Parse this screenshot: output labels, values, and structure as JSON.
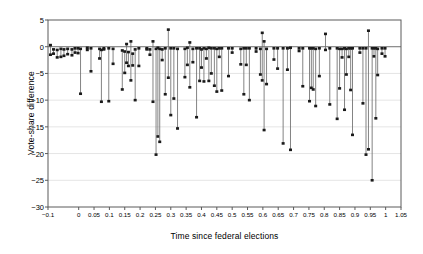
{
  "chart_data": {
    "type": "scatter",
    "title": "",
    "xlabel": "Time since federal elections",
    "ylabel": "Vote-share difference",
    "xlim": [
      -0.1,
      1.05
    ],
    "ylim": [
      -30,
      5
    ],
    "grid": true,
    "legend": null,
    "marker": "filled-square-with-vertical-range-line",
    "xticks": [
      "-0.1",
      "0",
      "0.05",
      "0.1",
      "0.15",
      "0.2",
      "0.25",
      "0.3",
      "0.35",
      "0.4",
      "0.45",
      "0.5",
      "0.55",
      "0.6",
      "0.65",
      "0.7",
      "0.75",
      "0.8",
      "0.85",
      "0.9",
      "0.95",
      "1",
      "1.05"
    ],
    "xtick_values": [
      -0.1,
      0,
      0.05,
      0.1,
      0.15,
      0.2,
      0.25,
      0.3,
      0.35,
      0.4,
      0.45,
      0.5,
      0.55,
      0.6,
      0.65,
      0.7,
      0.75,
      0.8,
      0.85,
      0.9,
      0.95,
      1,
      1.05
    ],
    "yticks": [
      "5",
      "0",
      "-5",
      "-10",
      "-15",
      "-20",
      "-25",
      "-30"
    ],
    "ytick_values": [
      5,
      0,
      -5,
      -10,
      -15,
      -20,
      -25,
      -30
    ],
    "series": [
      {
        "name": "Vote-share difference range",
        "points": [
          {
            "x": -0.092,
            "top": 0.3,
            "bottom": -1.5
          },
          {
            "x": -0.082,
            "top": -0.5,
            "bottom": -1.3
          },
          {
            "x": -0.07,
            "top": -0.6,
            "bottom": -2.0
          },
          {
            "x": -0.058,
            "top": -0.4,
            "bottom": -1.9
          },
          {
            "x": -0.048,
            "top": -0.5,
            "bottom": -1.7
          },
          {
            "x": -0.036,
            "top": -0.4,
            "bottom": -1.4
          },
          {
            "x": -0.022,
            "top": -0.5,
            "bottom": -1.6
          },
          {
            "x": -0.012,
            "top": -0.3,
            "bottom": -1.1
          },
          {
            "x": -0.002,
            "top": -0.3,
            "bottom": -1.2
          },
          {
            "x": 0.006,
            "top": -0.4,
            "bottom": -8.8
          },
          {
            "x": 0.028,
            "top": -0.2,
            "bottom": -0.6
          },
          {
            "x": 0.04,
            "top": -0.3,
            "bottom": -4.6
          },
          {
            "x": 0.068,
            "top": -0.4,
            "bottom": -2.2
          },
          {
            "x": 0.074,
            "top": -0.6,
            "bottom": -10.3
          },
          {
            "x": 0.082,
            "top": -0.3,
            "bottom": -0.5
          },
          {
            "x": 0.098,
            "top": -0.3,
            "bottom": -10.2
          },
          {
            "x": 0.112,
            "top": -0.4,
            "bottom": -3.2
          },
          {
            "x": 0.142,
            "top": -0.7,
            "bottom": -8.0
          },
          {
            "x": 0.15,
            "top": -0.9,
            "bottom": -4.9
          },
          {
            "x": 0.156,
            "top": 0.5,
            "bottom": -3.0
          },
          {
            "x": 0.162,
            "top": -1.0,
            "bottom": -3.6
          },
          {
            "x": 0.17,
            "top": 1.0,
            "bottom": -6.3
          },
          {
            "x": 0.176,
            "top": -1.3,
            "bottom": -3.5
          },
          {
            "x": 0.184,
            "top": -0.5,
            "bottom": -10.0
          },
          {
            "x": 0.196,
            "top": -0.3,
            "bottom": -3.6
          },
          {
            "x": 0.222,
            "top": -0.3,
            "bottom": -0.5
          },
          {
            "x": 0.232,
            "top": -0.5,
            "bottom": -1.5
          },
          {
            "x": 0.242,
            "top": 1.0,
            "bottom": -10.3
          },
          {
            "x": 0.252,
            "top": -0.4,
            "bottom": -20.2
          },
          {
            "x": 0.258,
            "top": -0.2,
            "bottom": -16.8
          },
          {
            "x": 0.264,
            "top": -0.4,
            "bottom": -17.8
          },
          {
            "x": 0.272,
            "top": -0.5,
            "bottom": -2.5
          },
          {
            "x": 0.282,
            "top": -0.3,
            "bottom": -8.9
          },
          {
            "x": 0.292,
            "top": 3.2,
            "bottom": -5.8
          },
          {
            "x": 0.3,
            "top": -0.3,
            "bottom": -12.8
          },
          {
            "x": 0.31,
            "top": -0.3,
            "bottom": -9.7
          },
          {
            "x": 0.322,
            "top": -0.4,
            "bottom": -15.3
          },
          {
            "x": 0.346,
            "top": -0.4,
            "bottom": -5.7
          },
          {
            "x": 0.354,
            "top": -0.2,
            "bottom": -3.4
          },
          {
            "x": 0.362,
            "top": 0.8,
            "bottom": -7.6
          },
          {
            "x": 0.372,
            "top": -0.4,
            "bottom": -2.9
          },
          {
            "x": 0.384,
            "top": -0.3,
            "bottom": -13.2
          },
          {
            "x": 0.394,
            "top": -0.3,
            "bottom": -6.4
          },
          {
            "x": 0.4,
            "top": -0.5,
            "bottom": -3.9
          },
          {
            "x": 0.408,
            "top": -0.3,
            "bottom": -6.5
          },
          {
            "x": 0.416,
            "top": -0.4,
            "bottom": -2.2
          },
          {
            "x": 0.424,
            "top": -0.2,
            "bottom": -6.4
          },
          {
            "x": 0.432,
            "top": -0.3,
            "bottom": -5.0
          },
          {
            "x": 0.442,
            "top": -0.3,
            "bottom": -7.3
          },
          {
            "x": 0.45,
            "top": -0.4,
            "bottom": -8.4
          },
          {
            "x": 0.458,
            "top": -0.3,
            "bottom": -1.9
          },
          {
            "x": 0.466,
            "top": -0.3,
            "bottom": -8.2
          },
          {
            "x": 0.488,
            "top": -0.3,
            "bottom": -5.5
          },
          {
            "x": 0.5,
            "top": -0.3,
            "bottom": -1.1
          },
          {
            "x": 0.528,
            "top": -0.4,
            "bottom": -3.3
          },
          {
            "x": 0.538,
            "top": -0.3,
            "bottom": -8.9
          },
          {
            "x": 0.546,
            "top": -0.3,
            "bottom": -3.4
          },
          {
            "x": 0.556,
            "top": -0.3,
            "bottom": -10.0
          },
          {
            "x": 0.578,
            "top": -0.3,
            "bottom": -0.9
          },
          {
            "x": 0.592,
            "top": -0.4,
            "bottom": -5.2
          },
          {
            "x": 0.598,
            "top": 2.6,
            "bottom": -6.3
          },
          {
            "x": 0.604,
            "top": 1.0,
            "bottom": -15.6
          },
          {
            "x": 0.612,
            "top": -0.4,
            "bottom": -7.0
          },
          {
            "x": 0.636,
            "top": -0.3,
            "bottom": -2.4
          },
          {
            "x": 0.648,
            "top": -0.3,
            "bottom": -4.1
          },
          {
            "x": 0.666,
            "top": -0.3,
            "bottom": -18.1
          },
          {
            "x": 0.68,
            "top": -0.3,
            "bottom": -4.3
          },
          {
            "x": 0.69,
            "top": -0.2,
            "bottom": -19.3
          },
          {
            "x": 0.718,
            "top": -0.3,
            "bottom": -0.8
          },
          {
            "x": 0.73,
            "top": -0.3,
            "bottom": -7.4
          },
          {
            "x": 0.752,
            "top": -0.3,
            "bottom": -10.2
          },
          {
            "x": 0.758,
            "top": -0.3,
            "bottom": -7.7
          },
          {
            "x": 0.764,
            "top": -0.3,
            "bottom": -8.0
          },
          {
            "x": 0.772,
            "top": -0.4,
            "bottom": -11.1
          },
          {
            "x": 0.784,
            "top": -0.3,
            "bottom": -5.5
          },
          {
            "x": 0.804,
            "top": 2.4,
            "bottom": -0.6
          },
          {
            "x": 0.818,
            "top": -0.3,
            "bottom": -10.8
          },
          {
            "x": 0.842,
            "top": -0.3,
            "bottom": -13.5
          },
          {
            "x": 0.85,
            "top": -0.4,
            "bottom": -7.8
          },
          {
            "x": 0.858,
            "top": -0.4,
            "bottom": -2.0
          },
          {
            "x": 0.866,
            "top": -0.3,
            "bottom": -11.8
          },
          {
            "x": 0.872,
            "top": -0.4,
            "bottom": -5.2
          },
          {
            "x": 0.88,
            "top": -0.3,
            "bottom": -1.9
          },
          {
            "x": 0.886,
            "top": -0.3,
            "bottom": -8.1
          },
          {
            "x": 0.892,
            "top": -0.3,
            "bottom": -16.5
          },
          {
            "x": 0.916,
            "top": -0.3,
            "bottom": -1.1
          },
          {
            "x": 0.926,
            "top": -0.3,
            "bottom": -10.6
          },
          {
            "x": 0.936,
            "top": -0.3,
            "bottom": -20.2
          },
          {
            "x": 0.944,
            "top": 3.0,
            "bottom": -19.2
          },
          {
            "x": 0.956,
            "top": -0.3,
            "bottom": -25.0
          },
          {
            "x": 0.962,
            "top": -0.3,
            "bottom": -1.8
          },
          {
            "x": 0.968,
            "top": -0.3,
            "bottom": -13.4
          },
          {
            "x": 0.974,
            "top": -0.4,
            "bottom": -5.3
          },
          {
            "x": 0.988,
            "top": -0.3,
            "bottom": -1.3
          },
          {
            "x": 0.998,
            "top": -0.3,
            "bottom": -1.8
          }
        ]
      }
    ]
  },
  "colors": {
    "axis": "#5a5a5a",
    "grid": "#d9d9d9",
    "marker": "#1a1a1a",
    "line": "#6e6e6e",
    "background": "#ffffff"
  }
}
